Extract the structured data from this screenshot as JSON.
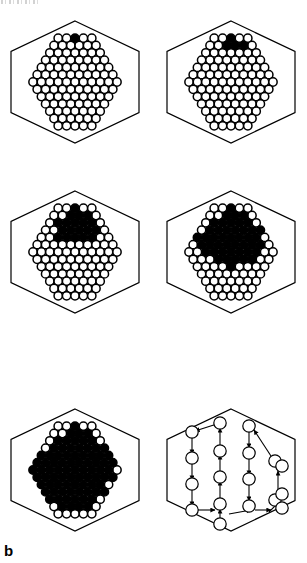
{
  "figure": {
    "panel_label": "b",
    "label_position": {
      "x": 4,
      "y": 543
    },
    "width": 307,
    "height": 563,
    "background_color": "#ffffff",
    "ink_color": "#000000",
    "scan_artifact": {
      "present": true,
      "x": 1,
      "y": 0,
      "width": 40,
      "height": 4
    }
  },
  "lattice": {
    "circle_radius": 4.15,
    "circle_stroke_width": 1.5,
    "row_count": 13,
    "row_spacing": 7.3,
    "column_spacing": 8.4,
    "open_fill": "#ffffff",
    "filled_fill": "#000000",
    "stroke": "#000000"
  },
  "hexagon": {
    "stroke": "#000000",
    "stroke_width": 1.2,
    "fill": "none",
    "half_width": 64,
    "half_height": 61
  },
  "panels": [
    {
      "index": 1,
      "name": "panel-growth-step-1",
      "center": {
        "x": 75,
        "y": 82
      },
      "hex_center": {
        "x": 75,
        "y": 82
      },
      "filled_description": "single black circle at the top apex row",
      "filled_count": 1,
      "filled_cells": [
        [
          0,
          0
        ]
      ]
    },
    {
      "index": 2,
      "name": "panel-growth-step-2",
      "center": {
        "x": 231,
        "y": 82
      },
      "hex_center": {
        "x": 231,
        "y": 82
      },
      "filled_description": "small cluster of four black circles at the top",
      "filled_count": 4,
      "filled_cells": [
        [
          0,
          0
        ],
        [
          1,
          -1
        ],
        [
          1,
          0
        ],
        [
          1,
          1
        ]
      ]
    },
    {
      "index": 3,
      "name": "panel-growth-step-3",
      "center": {
        "x": 75,
        "y": 252
      },
      "hex_center": {
        "x": 75,
        "y": 252
      },
      "filled_description": "triangular black cluster spanning the upper rows",
      "filled_count": 19,
      "filled_cells": [
        [
          0,
          0
        ],
        [
          1,
          -1
        ],
        [
          1,
          0
        ],
        [
          1,
          1
        ],
        [
          2,
          -2
        ],
        [
          2,
          -1
        ],
        [
          2,
          0
        ],
        [
          2,
          1
        ],
        [
          2,
          2
        ],
        [
          3,
          -2
        ],
        [
          3,
          -1
        ],
        [
          3,
          0
        ],
        [
          3,
          1
        ],
        [
          3,
          2
        ],
        [
          4,
          -2
        ],
        [
          4,
          -1
        ],
        [
          4,
          0
        ],
        [
          4,
          1
        ],
        [
          4,
          2
        ]
      ]
    },
    {
      "index": 4,
      "name": "panel-growth-step-4",
      "center": {
        "x": 231,
        "y": 252
      },
      "hex_center": {
        "x": 231,
        "y": 252
      },
      "filled_description": "large black region covering the top third of the lattice",
      "filled_count": 45,
      "filled_cells": [
        [
          0,
          0
        ],
        [
          1,
          -1
        ],
        [
          1,
          0
        ],
        [
          1,
          1
        ],
        [
          2,
          -2
        ],
        [
          2,
          -1
        ],
        [
          2,
          0
        ],
        [
          2,
          1
        ],
        [
          2,
          2
        ],
        [
          3,
          -3
        ],
        [
          3,
          -2
        ],
        [
          3,
          -1
        ],
        [
          3,
          0
        ],
        [
          3,
          1
        ],
        [
          3,
          2
        ],
        [
          3,
          3
        ],
        [
          4,
          -4
        ],
        [
          4,
          -3
        ],
        [
          4,
          -2
        ],
        [
          4,
          -1
        ],
        [
          4,
          0
        ],
        [
          4,
          1
        ],
        [
          4,
          2
        ],
        [
          4,
          3
        ],
        [
          5,
          -4
        ],
        [
          5,
          -3
        ],
        [
          5,
          -2
        ],
        [
          5,
          -1
        ],
        [
          5,
          0
        ],
        [
          5,
          1
        ],
        [
          5,
          2
        ],
        [
          5,
          3
        ],
        [
          6,
          -3
        ],
        [
          6,
          -2
        ],
        [
          6,
          -1
        ],
        [
          6,
          0
        ],
        [
          6,
          1
        ],
        [
          6,
          2
        ],
        [
          6,
          3
        ],
        [
          7,
          -2
        ],
        [
          7,
          -1
        ],
        [
          7,
          0
        ],
        [
          7,
          1
        ],
        [
          7,
          2
        ],
        [
          8,
          0
        ]
      ]
    },
    {
      "index": 5,
      "name": "panel-growth-step-5",
      "center": {
        "x": 75,
        "y": 470
      },
      "hex_center": {
        "x": 75,
        "y": 470
      },
      "filled_description": "very large black region covering most of the lattice except the outer rim and lower rows",
      "filled_count": 84,
      "filled_cells": [
        [
          0,
          0
        ],
        [
          1,
          -1
        ],
        [
          1,
          0
        ],
        [
          1,
          1
        ],
        [
          2,
          -2
        ],
        [
          2,
          -1
        ],
        [
          2,
          0
        ],
        [
          2,
          1
        ],
        [
          2,
          2
        ],
        [
          3,
          -3
        ],
        [
          3,
          -2
        ],
        [
          3,
          -1
        ],
        [
          3,
          0
        ],
        [
          3,
          1
        ],
        [
          3,
          2
        ],
        [
          3,
          3
        ],
        [
          4,
          -4
        ],
        [
          4,
          -3
        ],
        [
          4,
          -2
        ],
        [
          4,
          -1
        ],
        [
          4,
          0
        ],
        [
          4,
          1
        ],
        [
          4,
          2
        ],
        [
          4,
          3
        ],
        [
          4,
          4
        ],
        [
          5,
          -5
        ],
        [
          5,
          -4
        ],
        [
          5,
          -3
        ],
        [
          5,
          -2
        ],
        [
          5,
          -1
        ],
        [
          5,
          0
        ],
        [
          5,
          1
        ],
        [
          5,
          2
        ],
        [
          5,
          3
        ],
        [
          5,
          4
        ],
        [
          6,
          -5
        ],
        [
          6,
          -4
        ],
        [
          6,
          -3
        ],
        [
          6,
          -2
        ],
        [
          6,
          -1
        ],
        [
          6,
          0
        ],
        [
          6,
          1
        ],
        [
          6,
          2
        ],
        [
          6,
          3
        ],
        [
          6,
          4
        ],
        [
          7,
          -5
        ],
        [
          7,
          -4
        ],
        [
          7,
          -3
        ],
        [
          7,
          -2
        ],
        [
          7,
          -1
        ],
        [
          7,
          0
        ],
        [
          7,
          1
        ],
        [
          7,
          2
        ],
        [
          7,
          3
        ],
        [
          7,
          4
        ],
        [
          8,
          -4
        ],
        [
          8,
          -3
        ],
        [
          8,
          -2
        ],
        [
          8,
          -1
        ],
        [
          8,
          0
        ],
        [
          8,
          1
        ],
        [
          8,
          2
        ],
        [
          8,
          3
        ],
        [
          9,
          -4
        ],
        [
          9,
          -3
        ],
        [
          9,
          -2
        ],
        [
          9,
          -1
        ],
        [
          9,
          0
        ],
        [
          9,
          1
        ],
        [
          9,
          2
        ],
        [
          9,
          3
        ],
        [
          10,
          -3
        ],
        [
          10,
          -2
        ],
        [
          10,
          -1
        ],
        [
          10,
          0
        ],
        [
          10,
          1
        ],
        [
          10,
          2
        ],
        [
          11,
          -2
        ],
        [
          11,
          -1
        ],
        [
          11,
          0
        ],
        [
          11,
          1
        ]
      ]
    },
    {
      "index": 6,
      "name": "panel-arrow-diagram",
      "center": {
        "x": 231,
        "y": 470
      },
      "hex_center": {
        "x": 231,
        "y": 470
      },
      "filled_description": "sparse open circles connected by directed arrows forming vertical and diagonal flow paths",
      "filled_count": 0,
      "circle_radius": 6.2,
      "nodes": [
        {
          "id": "n1",
          "x": -39,
          "y": -38
        },
        {
          "id": "n2",
          "x": -39,
          "y": -12
        },
        {
          "id": "n3",
          "x": -39,
          "y": 14
        },
        {
          "id": "n4",
          "x": -39,
          "y": 40
        },
        {
          "id": "n5",
          "x": -11,
          "y": -47
        },
        {
          "id": "n6",
          "x": -11,
          "y": -19
        },
        {
          "id": "n7",
          "x": -11,
          "y": 7
        },
        {
          "id": "n8",
          "x": -11,
          "y": 34
        },
        {
          "id": "n9",
          "x": -11,
          "y": 54
        },
        {
          "id": "n10",
          "x": 18,
          "y": -44
        },
        {
          "id": "n11",
          "x": 18,
          "y": -17
        },
        {
          "id": "n12",
          "x": 18,
          "y": 9
        },
        {
          "id": "n13",
          "x": 18,
          "y": 36
        },
        {
          "id": "n14",
          "x": 44,
          "y": -9
        },
        {
          "id": "n15",
          "x": 51,
          "y": -4
        },
        {
          "id": "n16",
          "x": 44,
          "y": 30
        },
        {
          "id": "n17",
          "x": 51,
          "y": 24
        },
        {
          "id": "n18",
          "x": 51,
          "y": 38
        }
      ],
      "arrows": [
        {
          "from": [
            -11,
            -47
          ],
          "to": [
            -36,
            -39
          ],
          "name": "arrow-diag-down-left-top"
        },
        {
          "from": [
            -39,
            -34
          ],
          "to": [
            -39,
            -16
          ],
          "name": "arrow-down-left-col-1"
        },
        {
          "from": [
            -39,
            -8
          ],
          "to": [
            -39,
            10
          ],
          "name": "arrow-down-left-col-2"
        },
        {
          "from": [
            -39,
            18
          ],
          "to": [
            -39,
            36
          ],
          "name": "arrow-down-left-col-3"
        },
        {
          "from": [
            -11,
            30
          ],
          "to": [
            -11,
            11
          ],
          "name": "arrow-up-mid-col-1"
        },
        {
          "from": [
            -11,
            3
          ],
          "to": [
            -11,
            -15
          ],
          "name": "arrow-up-mid-col-2"
        },
        {
          "from": [
            -11,
            -23
          ],
          "to": [
            -11,
            -42
          ],
          "name": "arrow-up-mid-col-3"
        },
        {
          "from": [
            -11,
            50
          ],
          "to": [
            -11,
            39
          ],
          "name": "arrow-up-mid-col-4"
        },
        {
          "from": [
            18,
            -40
          ],
          "to": [
            18,
            -22
          ],
          "name": "arrow-down-right-col-1"
        },
        {
          "from": [
            18,
            -13
          ],
          "to": [
            18,
            5
          ],
          "name": "arrow-down-right-col-2"
        },
        {
          "from": [
            18,
            13
          ],
          "to": [
            18,
            31
          ],
          "name": "arrow-down-right-col-3"
        },
        {
          "from": [
            40,
            -14
          ],
          "to": [
            23,
            -40
          ],
          "name": "arrow-diag-up-left-right-top"
        },
        {
          "from": [
            47,
            20
          ],
          "to": [
            47,
            1
          ],
          "name": "arrow-up-far-right"
        },
        {
          "from": [
            38,
            42
          ],
          "to": [
            47,
            33
          ],
          "name": "arrow-diag-up-right"
        },
        {
          "from": [
            -2,
            44
          ],
          "to": [
            20,
            40
          ],
          "name": "arrow-right-bottom"
        },
        {
          "from": [
            24,
            40
          ],
          "to": [
            40,
            40
          ],
          "name": "arrow-right-bottom-2"
        },
        {
          "from": [
            -34,
            40
          ],
          "to": [
            -16,
            40
          ],
          "name": "arrow-right-bottom-left"
        }
      ],
      "lines": [
        {
          "from": [
            -11,
            -47
          ],
          "to": [
            -11,
            -47
          ]
        }
      ]
    }
  ]
}
